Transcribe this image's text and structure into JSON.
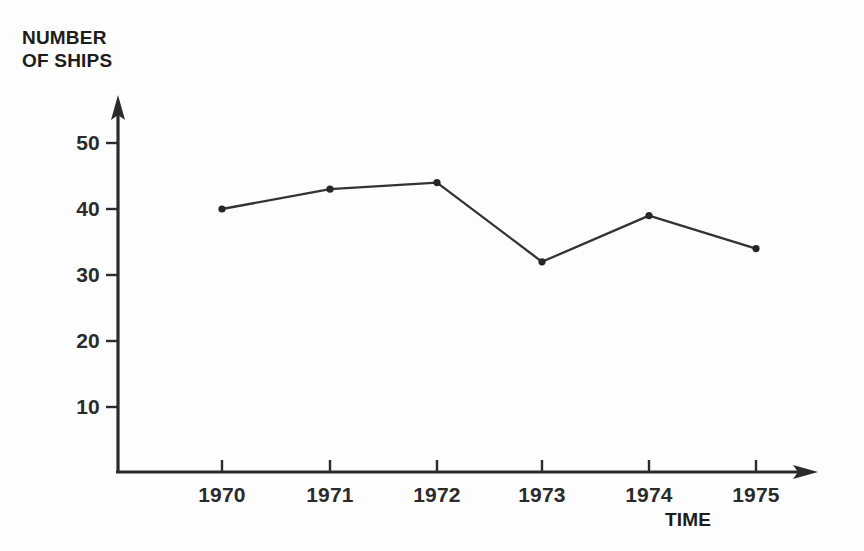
{
  "chart_data": {
    "type": "line",
    "title_lines": [
      "NUMBER",
      "OF SHIPS"
    ],
    "xlabel": "TIME",
    "ylabel": "NUMBER OF SHIPS",
    "categories": [
      "1970",
      "1971",
      "1972",
      "1973",
      "1974",
      "1975"
    ],
    "x": [
      1970,
      1971,
      1972,
      1973,
      1974,
      1975
    ],
    "values": [
      40,
      43,
      44,
      32,
      39,
      34
    ],
    "series": [
      {
        "name": "Number of ships",
        "values": [
          40,
          43,
          44,
          32,
          39,
          34
        ]
      }
    ],
    "yticks": [
      10,
      20,
      30,
      40,
      50
    ],
    "ytick_labels": [
      "10",
      "20",
      "30",
      "40",
      "50"
    ],
    "xtick_labels": [
      "1970",
      "1971",
      "1972",
      "1973",
      "1974",
      "1975"
    ],
    "ylim": [
      0,
      55
    ],
    "xlim": [
      1969.5,
      1975.8
    ],
    "grid": false,
    "legend": false,
    "legend_position": "none",
    "marker": "filled-circle",
    "line_color": "#333333",
    "marker_color": "#262626",
    "axis_color": "#2b2b2b",
    "background_color": "#fdfdfd",
    "axis_style": "arrow-tipped L-shaped axes"
  },
  "axes": {
    "y_axis_name": "y-axis",
    "x_axis_name": "x-axis",
    "y_arrow": "up-arrow",
    "x_arrow": "right-arrow"
  }
}
